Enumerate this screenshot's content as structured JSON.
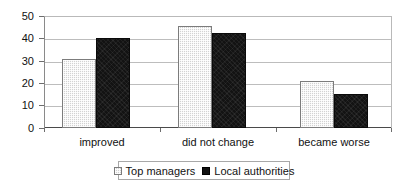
{
  "chart_data": {
    "type": "bar",
    "title": "",
    "subtitle": "",
    "xlabel": "",
    "ylabel": "",
    "categories": [
      "improved",
      "did not change",
      "became worse"
    ],
    "series": [
      {
        "name": "Top managers",
        "values": [
          31,
          45.5,
          21
        ],
        "color": "#d2d2d2",
        "pattern": "dotted-light-gray"
      },
      {
        "name": "Local authorities",
        "values": [
          40,
          42.5,
          15
        ],
        "color": "#131313",
        "pattern": "solid-black"
      }
    ],
    "ylim": [
      0,
      50
    ],
    "yticks": [
      0,
      10,
      20,
      30,
      40,
      50
    ],
    "ytick_labels": [
      "0",
      "10",
      "20",
      "30",
      "40",
      "50"
    ],
    "grid": true,
    "grid_axis": "y",
    "legend_position": "bottom",
    "legend_border": true
  },
  "axis": {
    "y_labels": [
      "50",
      "40",
      "30",
      "20",
      "10",
      "0"
    ]
  },
  "legend": {
    "entries": [
      {
        "label": "Top managers",
        "swatch": "light-gray-dotted-swatch"
      },
      {
        "label": "Local authorities",
        "swatch": "black-swatch"
      }
    ]
  }
}
